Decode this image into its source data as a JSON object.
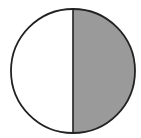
{
  "diagram": {
    "shape": "circle",
    "fractions": {
      "total_parts": 2,
      "shaded_parts": 1,
      "shaded_fraction": "1/2"
    },
    "colors": {
      "background": "#ffffff",
      "outline": "#222222",
      "shaded": "#9a9a9a",
      "unshaded": "#ffffff"
    },
    "geometry": {
      "cx": 73,
      "cy": 71,
      "r": 62
    }
  }
}
